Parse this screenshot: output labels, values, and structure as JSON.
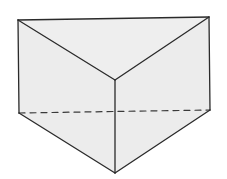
{
  "figure": {
    "shape": "triangular-prism",
    "colors": {
      "background": "#ffffff",
      "face_fill": "#ececec",
      "top_face_fill": "#eeeeee",
      "edge_stroke": "#2a2a2a",
      "hidden_edge_stroke": "#3a3a3a"
    },
    "vertices": {
      "top_left": [
        18,
        20
      ],
      "top_right": [
        209,
        17
      ],
      "top_front": [
        115,
        80
      ],
      "bottom_left": [
        19,
        113
      ],
      "bottom_right": [
        210,
        110
      ],
      "bottom_front": [
        115,
        173
      ]
    },
    "edges": {
      "visible": [
        [
          "top_left",
          "top_right"
        ],
        [
          "top_left",
          "top_front"
        ],
        [
          "top_right",
          "top_front"
        ],
        [
          "top_left",
          "bottom_left"
        ],
        [
          "top_right",
          "bottom_right"
        ],
        [
          "top_front",
          "bottom_front"
        ],
        [
          "bottom_left",
          "bottom_front"
        ],
        [
          "bottom_right",
          "bottom_front"
        ]
      ],
      "hidden": [
        [
          "bottom_left",
          "bottom_right"
        ]
      ]
    }
  }
}
